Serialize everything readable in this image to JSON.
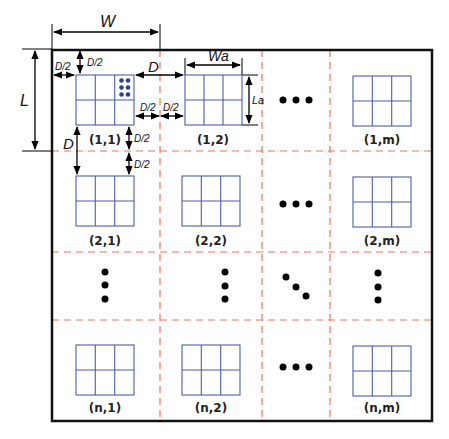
{
  "diagram": {
    "type": "array-grid-layout",
    "colors": {
      "outer_border": "#111111",
      "cell_divider": "#e8765a",
      "antenna_array": "#4a5fa8",
      "element_dots": "#2d3f8f",
      "dots": "#000000"
    },
    "dimensions": {
      "W": "W",
      "L": "L",
      "D": "D",
      "D_half": "D/2",
      "Wa": "Wa",
      "La": "La"
    },
    "cells": [
      {
        "row": 1,
        "col": 1,
        "label": "(1,1)",
        "content": "array",
        "highlight_elements": true
      },
      {
        "row": 1,
        "col": 2,
        "label": "(1,2)",
        "content": "array"
      },
      {
        "row": 1,
        "col": 3,
        "label": "",
        "content": "ellipsis-horizontal"
      },
      {
        "row": 1,
        "col": 4,
        "label": "(1,m)",
        "content": "array"
      },
      {
        "row": 2,
        "col": 1,
        "label": "(2,1)",
        "content": "array"
      },
      {
        "row": 2,
        "col": 2,
        "label": "(2,2)",
        "content": "array"
      },
      {
        "row": 2,
        "col": 3,
        "label": "",
        "content": "ellipsis-horizontal"
      },
      {
        "row": 2,
        "col": 4,
        "label": "(2,m)",
        "content": "array"
      },
      {
        "row": 3,
        "col": 1,
        "label": "",
        "content": "ellipsis-vertical"
      },
      {
        "row": 3,
        "col": 2,
        "label": "",
        "content": "ellipsis-vertical"
      },
      {
        "row": 3,
        "col": 3,
        "label": "",
        "content": "ellipsis-diagonal"
      },
      {
        "row": 3,
        "col": 4,
        "label": "",
        "content": "ellipsis-vertical"
      },
      {
        "row": 4,
        "col": 1,
        "label": "(n,1)",
        "content": "array"
      },
      {
        "row": 4,
        "col": 2,
        "label": "(n,2)",
        "content": "array"
      },
      {
        "row": 4,
        "col": 3,
        "label": "",
        "content": "ellipsis-horizontal"
      },
      {
        "row": 4,
        "col": 4,
        "label": "(n,m)",
        "content": "array"
      }
    ],
    "labels": {
      "c11": "(1,1)",
      "c12": "(1,2)",
      "c1m": "(1,m)",
      "c21": "(2,1)",
      "c22": "(2,2)",
      "c2m": "(2,m)",
      "cn1": "(n,1)",
      "cn2": "(n,2)",
      "cnm": "(n,m)"
    }
  }
}
